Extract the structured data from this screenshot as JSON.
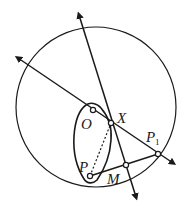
{
  "diagram": {
    "type": "geometry-figure",
    "labels": {
      "O": "O",
      "X": "X",
      "P1_main": "P",
      "P1_sub": "1",
      "P": "P",
      "M": "M"
    },
    "points": [
      "O",
      "X",
      "P1",
      "P",
      "M"
    ],
    "dashed_segment": [
      "P",
      "X"
    ],
    "colors": {
      "stroke": "#1a1a1a",
      "background": "#ffffff"
    }
  }
}
